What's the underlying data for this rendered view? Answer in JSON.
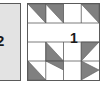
{
  "figure": {
    "type": "quilt-block-diagram",
    "background_color": "#ffffff",
    "line_color": "#5a5a5a",
    "fill_color": "#808080",
    "blank_color": "#ffffff"
  },
  "panels": [
    {
      "id": "panel-2",
      "label": "2",
      "clipped": true,
      "fill": "#e3e3e3",
      "x": -6,
      "y": 3,
      "width": 27,
      "height": 78
    },
    {
      "id": "panel-1",
      "label": "1",
      "clipped": false,
      "fill": "#ffffff",
      "x": 27,
      "y": 3,
      "width": 73,
      "height": 78,
      "grid": {
        "cols": 4,
        "rows": 4
      },
      "cells": [
        {
          "row": 0,
          "col": 0,
          "shape": "half-square-triangle",
          "corner": "top-right",
          "fill": "#808080"
        },
        {
          "row": 0,
          "col": 1,
          "shape": "half-square-triangle",
          "corner": "top-right",
          "fill": "#808080"
        },
        {
          "row": 0,
          "col": 2,
          "shape": "blank",
          "fill": "#ffffff"
        },
        {
          "row": 0,
          "col": 3,
          "shape": "half-square-triangle",
          "corner": "top-right",
          "fill": "#808080"
        },
        {
          "row": 1,
          "col": 0,
          "shape": "blank",
          "fill": "#ffffff"
        },
        {
          "row": 1,
          "col": 1,
          "shape": "blank",
          "fill": "#ffffff"
        },
        {
          "row": 1,
          "col": 2,
          "shape": "blank",
          "fill": "#ffffff"
        },
        {
          "row": 1,
          "col": 3,
          "shape": "blank",
          "fill": "#ffffff"
        },
        {
          "row": 2,
          "col": 0,
          "shape": "blank",
          "fill": "#ffffff"
        },
        {
          "row": 2,
          "col": 1,
          "shape": "half-square-triangle",
          "corner": "bottom-left",
          "fill": "#808080"
        },
        {
          "row": 2,
          "col": 2,
          "shape": "blank",
          "fill": "#ffffff"
        },
        {
          "row": 2,
          "col": 3,
          "shape": "half-square-triangle",
          "corner": "top-left",
          "fill": "#808080"
        },
        {
          "row": 3,
          "col": 0,
          "shape": "half-square-triangle",
          "corner": "bottom-left",
          "fill": "#808080"
        },
        {
          "row": 3,
          "col": 1,
          "shape": "half-square-triangle",
          "corner": "top-right",
          "fill": "#808080"
        },
        {
          "row": 3,
          "col": 2,
          "shape": "blank",
          "fill": "#ffffff"
        },
        {
          "row": 3,
          "col": 3,
          "shape": "half-square-triangle",
          "corner": "bottom-left",
          "fill": "#808080"
        }
      ],
      "row_divider_rows": [
        1,
        2
      ]
    }
  ]
}
